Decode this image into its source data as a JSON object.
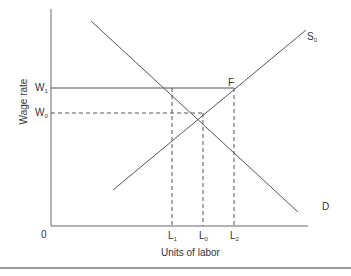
{
  "diagram": {
    "type": "labor-market-supply-demand",
    "y_axis_label": "Wage rate",
    "x_axis_label": "Units of labor",
    "origin_label": "0",
    "wage_levels": [
      {
        "id": "W1",
        "base": "W",
        "sub": "1"
      },
      {
        "id": "W0",
        "base": "W",
        "sub": "0"
      }
    ],
    "labor_levels": [
      {
        "id": "L1",
        "base": "L",
        "sub": "1"
      },
      {
        "id": "L0",
        "base": "L",
        "sub": "0"
      },
      {
        "id": "L2",
        "base": "L",
        "sub": "2"
      }
    ],
    "curves": [
      {
        "id": "D",
        "label": "D"
      },
      {
        "id": "S0",
        "base": "S",
        "sub": "0"
      }
    ],
    "point_label": "F",
    "colors": {
      "line": "#555555",
      "text": "#333333",
      "rule": "#999999"
    }
  }
}
